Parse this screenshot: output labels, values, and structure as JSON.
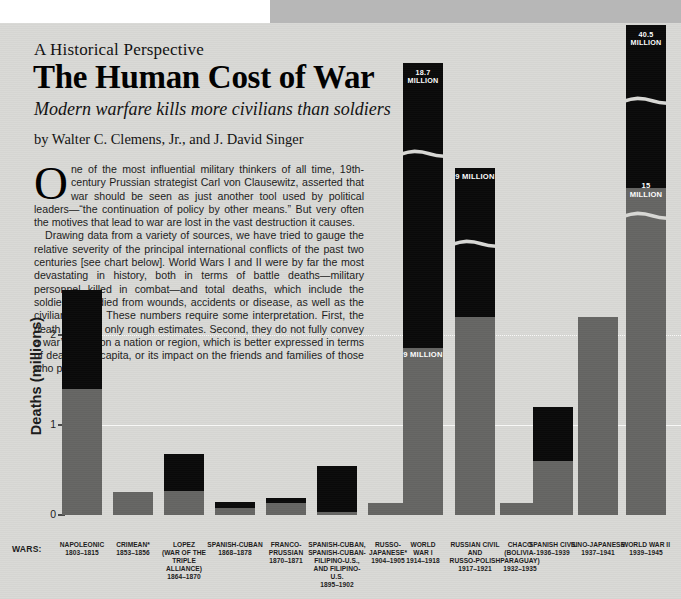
{
  "article": {
    "kicker": "A Historical Perspective",
    "headline": "The Human Cost of War",
    "deck": "Modern warfare kills more civilians than soldiers",
    "byline": "by Walter C. Clemens, Jr., and J. David Singer",
    "dropcap": "O",
    "paragraph1": "ne of the most influential military thinkers of all time, 19th-century Prussian strategist Carl von Clausewitz, asserted that war should be seen as just another tool used by political leaders—“the continuation of policy by other means.” But very often the motives that lead to war are lost in the vast destruction it causes.",
    "paragraph2": "Drawing data from a variety of sources, we have tried to gauge the relative severity of the principal international conflicts of the past two centuries [see chart below]. World Wars I and II were by far the most devastating in history, both in terms of battle deaths—military personnel killed in combat—and total deaths, which include the soldiers who died from wounds, accidents or disease, as well as the civilians killed. These numbers require some interpretation. First, the death tolls are only rough estimates. Second, they do not fully convey a war’s effect on a nation or region, which is better expressed in terms of deaths per capita, or its impact on the friends and families of those who perish."
  },
  "colors": {
    "page_background": "#d9d9d6",
    "bleed_block": "#b7b7b7",
    "battle_deaths": "#666664",
    "total_deaths": "#0a0a0a",
    "axis": "#4a4a4a",
    "label_text": "#1b1b1b",
    "value_label_text": "#ffffff"
  },
  "chart_data": {
    "type": "bar",
    "title": "",
    "xlabel": "WARS:",
    "ylabel": "Deaths (millions)",
    "ylim": [
      0,
      2.9
    ],
    "yticks": [
      "0",
      "1",
      "2"
    ],
    "grid": true,
    "legend": [
      {
        "name": "Battle deaths",
        "color": "#666664"
      },
      {
        "name": "Total deaths",
        "color": "#0a0a0a"
      }
    ],
    "stacked": true,
    "footnote": "*",
    "categories": [
      "NAPOLEONIC",
      "CRIMEAN*",
      "LOPEZ (WAR OF THE TRIPLE ALLIANCE)",
      "SPANISH-CUBAN",
      "FRANCO-PRUSSIAN",
      "SPANISH-CUBAN, SPANISH-CUBAN-FILIPINO-U.S., AND FILIPINO-U.S.",
      "RUSSO-JAPANESE*",
      "WORLD WAR I",
      "RUSSIAN CIVIL AND RUSSO-POLISH",
      "CHACO (BOLIVIA-PARAGUAY)",
      "SPANISH CIVIL",
      "SINO-JAPANESE",
      "WORLD WAR II"
    ],
    "bars": [
      {
        "name": "NAPOLEONIC",
        "name_lines": [
          "NAPOLEONIC"
        ],
        "years": "1803–1815",
        "battle_deaths": 1.4,
        "total_deaths": 2.5,
        "truncated": false,
        "value_label": "",
        "battle_label": "",
        "x": 62,
        "width": 40
      },
      {
        "name": "CRIMEAN*",
        "name_lines": [
          "CRIMEAN*"
        ],
        "years": "1853–1856",
        "battle_deaths": 0.26,
        "total_deaths": 0.26,
        "truncated": false,
        "value_label": "",
        "battle_label": "",
        "x": 113,
        "width": 40
      },
      {
        "name": "LOPEZ",
        "name_lines": [
          "LOPEZ",
          "(WAR OF THE",
          "TRIPLE ALLIANCE)"
        ],
        "years": "1864–1870",
        "battle_deaths": 0.27,
        "total_deaths": 0.68,
        "truncated": false,
        "value_label": "",
        "battle_label": "",
        "x": 164,
        "width": 40
      },
      {
        "name": "SPANISH-CUBAN",
        "name_lines": [
          "SPANISH-CUBAN"
        ],
        "years": "1868–1878",
        "battle_deaths": 0.08,
        "total_deaths": 0.14,
        "truncated": false,
        "value_label": "",
        "battle_label": "",
        "x": 215,
        "width": 40
      },
      {
        "name": "FRANCO-PRUSSIAN",
        "name_lines": [
          "FRANCO-",
          "PRUSSIAN"
        ],
        "years": "1870–1871",
        "battle_deaths": 0.13,
        "total_deaths": 0.19,
        "truncated": false,
        "value_label": "",
        "battle_label": "",
        "x": 266,
        "width": 40
      },
      {
        "name": "SPANISH-CUBAN, SPANISH-CUBAN-FILIPINO-U.S., AND FILIPINO-U.S.",
        "name_lines": [
          "SPANISH-CUBAN,",
          "SPANISH-CUBAN-",
          "FILIPINO-U.S.,",
          "AND FILIPINO-U.S."
        ],
        "years": "1895–1902",
        "battle_deaths": 0.03,
        "total_deaths": 0.55,
        "truncated": false,
        "value_label": "",
        "battle_label": "",
        "x": 317,
        "width": 40
      },
      {
        "name": "RUSSO-JAPANESE*",
        "name_lines": [
          "RUSSO-",
          "JAPANESE*"
        ],
        "years": "1904–1905",
        "battle_deaths": 0.13,
        "total_deaths": 0.13,
        "truncated": false,
        "value_label": "",
        "battle_label": "",
        "x": 368,
        "width": 40
      },
      {
        "name": "WORLD WAR I",
        "name_lines": [
          "WORLD",
          "WAR I"
        ],
        "years": "1914–1918",
        "battle_deaths": 9.0,
        "total_deaths": 18.7,
        "truncated": true,
        "value_label": "18.7 MILLION",
        "battle_label": "9 MILLION",
        "x": 403,
        "width": 40
      },
      {
        "name": "RUSSIAN CIVIL AND RUSSO-POLISH",
        "name_lines": [
          "RUSSIAN CIVIL",
          "AND",
          "RUSSO-POLISH"
        ],
        "years": "1917–1921",
        "battle_deaths": 2.2,
        "total_deaths": 9.0,
        "truncated": true,
        "value_label": "9 MILLION",
        "battle_label": "",
        "x": 455,
        "width": 40
      },
      {
        "name": "CHACO",
        "name_lines": [
          "CHACO",
          "(BOLIVIA-",
          "PARAGUAY)"
        ],
        "years": "1932–1935",
        "battle_deaths": 0.13,
        "total_deaths": 0.13,
        "truncated": false,
        "value_label": "",
        "battle_label": "",
        "x": 500,
        "width": 40
      },
      {
        "name": "SPANISH CIVIL",
        "name_lines": [
          "SPANISH CIVIL"
        ],
        "years": "1936–1939",
        "battle_deaths": 0.6,
        "total_deaths": 1.2,
        "truncated": false,
        "value_label": "",
        "battle_label": "",
        "x": 533,
        "width": 40
      },
      {
        "name": "SINO-JAPANESE",
        "name_lines": [
          "SINO-JAPANESE"
        ],
        "years": "1937–1941",
        "battle_deaths": 2.2,
        "total_deaths": 2.2,
        "truncated": false,
        "value_label": "",
        "battle_label": "",
        "x": 578,
        "width": 40
      },
      {
        "name": "WORLD WAR II",
        "name_lines": [
          "WORLD WAR II"
        ],
        "years": "1939–1945",
        "battle_deaths": 15.0,
        "total_deaths": 40.5,
        "truncated": true,
        "value_label": "40.5 MILLION",
        "battle_label": "15 MILLION",
        "x": 626,
        "width": 40
      }
    ]
  }
}
